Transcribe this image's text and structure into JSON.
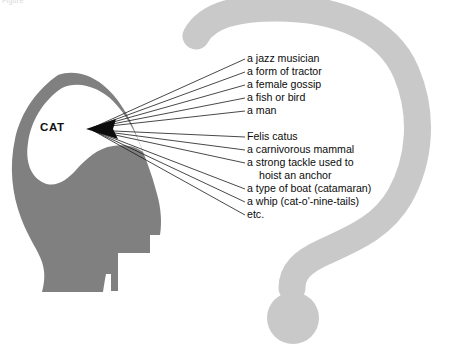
{
  "figure": {
    "caption_fragment": "Figure",
    "thinker_label": "CAT",
    "colors": {
      "question_mark": "#c9c9c9",
      "head_silhouette": "#808080",
      "cavity": "#ffffff",
      "leader_line": "#1a1a1a",
      "text": "#0b0b0b",
      "background": "#ffffff"
    }
  },
  "senses": {
    "group_a": [
      {
        "text": "a jazz musician",
        "indented": false
      },
      {
        "text": "a form of tractor",
        "indented": false
      },
      {
        "text": "a female gossip",
        "indented": false
      },
      {
        "text": "a fish or bird",
        "indented": false
      },
      {
        "text": "a man",
        "indented": false
      }
    ],
    "group_b": [
      {
        "text": "Felis catus",
        "indented": false
      },
      {
        "text": "a carnivorous mammal",
        "indented": false
      },
      {
        "text": "a strong tackle used to",
        "indented": false
      },
      {
        "text": "hoist an anchor",
        "indented": true
      },
      {
        "text": "a type of boat (catamaran)",
        "indented": false
      },
      {
        "text": "a whip (cat-o'-nine-tails)",
        "indented": false
      },
      {
        "text": "etc.",
        "indented": false
      }
    ]
  }
}
